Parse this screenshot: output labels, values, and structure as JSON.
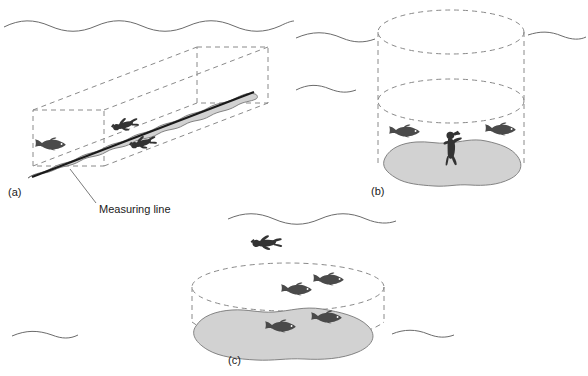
{
  "figure": {
    "background_color": "#ffffff",
    "line_color": "#5a5a5a",
    "dark_line_color": "#1a1a1a",
    "substrate_fill": "#d2d2d2",
    "substrate_stroke": "#777777",
    "organism_fill": "#4a4a4a",
    "diver_fill": "#333333"
  },
  "annotations": {
    "measuring_line_label": "Measuring line"
  },
  "panels": [
    {
      "id": "a",
      "label": "(a)",
      "method_name": "belt-transect",
      "shape": "rectangular-box",
      "divers": 2,
      "fish": 1,
      "has_measuring_line": true,
      "has_water_surface": true
    },
    {
      "id": "b",
      "label": "(b)",
      "method_name": "stationary-point-count-tall-cylinder",
      "shape": "tall-cylinder",
      "divers": 1,
      "fish": 2,
      "has_measuring_line": false,
      "has_water_surface": true
    },
    {
      "id": "c",
      "label": "(c)",
      "method_name": "stationary-point-count-short-cylinder",
      "shape": "short-cylinder",
      "divers": 1,
      "fish": 4,
      "has_measuring_line": false,
      "has_water_surface": true
    }
  ]
}
